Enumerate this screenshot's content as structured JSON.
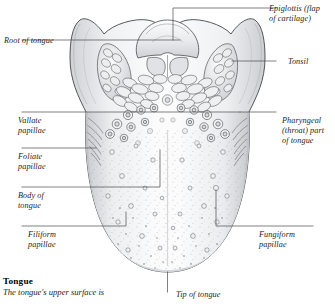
{
  "figure": {
    "ink": "#2b2b2b",
    "leader_color": "#555555",
    "tissue_light": "#f7f7f8",
    "tissue_mid": "#e3e4e6",
    "tissue_shadow": "#c3c5c8"
  },
  "labels": {
    "epiglottis": "Epiglottis (flap\nof cartilage)",
    "tonsil": "Tonsil",
    "root": "Root of tongue",
    "vallate": "Vallate\npapillae",
    "foliate": "Foliate\npapillae",
    "pharyngeal": "Pharyngeal\n(throat) part\nof tongue",
    "body": "Body of\ntongue",
    "filiform": "Filiform\npapillae",
    "fungiform": "Fungiform\npapillae",
    "tip": "Tip of tongue"
  },
  "caption": {
    "title": "Tongue",
    "text": "The tongue's upper surface is"
  }
}
